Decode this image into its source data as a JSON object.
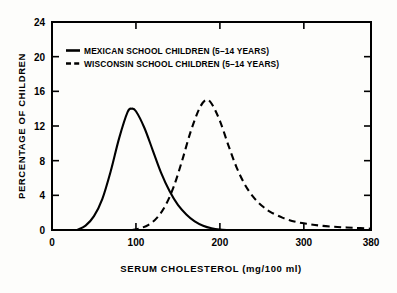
{
  "chart_data": {
    "type": "line",
    "title": "",
    "xlabel": "SERUM CHOLESTEROL (mg/100 ml)",
    "ylabel": "PERCENTAGE OF CHILDREN",
    "xlim": [
      0,
      380
    ],
    "ylim": [
      0,
      24
    ],
    "xticks": [
      0,
      100,
      200,
      300,
      380
    ],
    "xtick_labels": [
      "0",
      "100",
      "200",
      "300",
      "380"
    ],
    "yticks": [
      0,
      4,
      8,
      12,
      16,
      20,
      24
    ],
    "ytick_labels": [
      "0",
      "4",
      "8",
      "12",
      "16",
      "20",
      "24"
    ],
    "grid": false,
    "legend_position": "top-left-inside",
    "series": [
      {
        "name": "MEXICAN SCHOOL CHILDREN (5–14 YEARS)",
        "style": "solid",
        "peak_x": 95,
        "peak_y": 14.0,
        "x": [
          30,
          40,
          50,
          60,
          70,
          80,
          90,
          95,
          100,
          110,
          120,
          130,
          140,
          150,
          160,
          170,
          180,
          190,
          200,
          210
        ],
        "y": [
          0.0,
          0.5,
          1.6,
          3.6,
          6.8,
          10.6,
          13.6,
          14.0,
          13.7,
          11.8,
          9.2,
          6.6,
          4.5,
          2.9,
          1.8,
          1.0,
          0.5,
          0.2,
          0.05,
          0.0
        ]
      },
      {
        "name": "WISCONSIN SCHOOL CHILDREN (5–14 YEARS)",
        "style": "dashed",
        "peak_x": 183,
        "peak_y": 15.0,
        "x": [
          95,
          105,
          115,
          125,
          135,
          145,
          155,
          165,
          175,
          183,
          190,
          200,
          210,
          220,
          230,
          240,
          250,
          260,
          275,
          290,
          305,
          320,
          340,
          360,
          380
        ],
        "y": [
          0.0,
          0.2,
          0.6,
          1.4,
          2.8,
          5.0,
          8.0,
          11.3,
          13.9,
          15.0,
          14.6,
          12.6,
          9.8,
          7.2,
          5.2,
          3.8,
          2.8,
          2.1,
          1.4,
          0.95,
          0.7,
          0.5,
          0.35,
          0.25,
          0.15
        ]
      }
    ]
  },
  "legend": {
    "entries": [
      {
        "label": "MEXICAN SCHOOL CHILDREN (5–14 YEARS)",
        "style": "solid"
      },
      {
        "label": "WISCONSIN SCHOOL CHILDREN (5–14 YEARS)",
        "style": "dashed"
      }
    ]
  },
  "colors": {
    "ink": "#000000",
    "paper": "#fdfdfb"
  }
}
